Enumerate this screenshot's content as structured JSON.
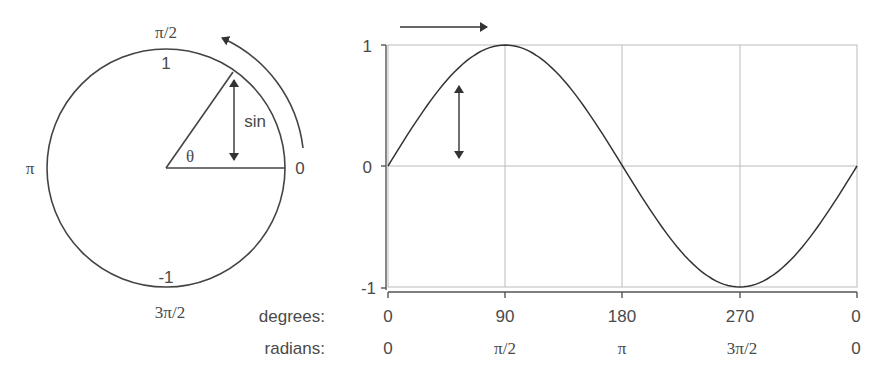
{
  "circle": {
    "labels": {
      "top_angle": "π/2",
      "top_value": "1",
      "left_angle": "π",
      "right_angle": "0",
      "bottom_value": "-1",
      "bottom_angle": "3π/2",
      "theta": "θ",
      "sin": "sin"
    }
  },
  "chart_data": {
    "type": "line",
    "title": "",
    "xlabel": "",
    "ylabel": "",
    "x_degrees": [
      0,
      90,
      180,
      270,
      360
    ],
    "x_tick_labels_degrees": [
      "0",
      "90",
      "180",
      "270",
      "0"
    ],
    "x_tick_labels_radians": [
      "0",
      "π/2",
      "π",
      "3π/2",
      "0"
    ],
    "y_ticks": [
      "1",
      "0",
      "-1"
    ],
    "ylim": [
      -1,
      1
    ],
    "grid": true,
    "series": [
      {
        "name": "sin",
        "x": [
          0,
          45,
          90,
          135,
          180,
          225,
          270,
          315,
          360
        ],
        "values": [
          0,
          0.707,
          1,
          0.707,
          0,
          -0.707,
          -1,
          -0.707,
          0
        ]
      }
    ]
  },
  "axis_labels": {
    "degrees": "degrees:",
    "radians": "radians:"
  }
}
